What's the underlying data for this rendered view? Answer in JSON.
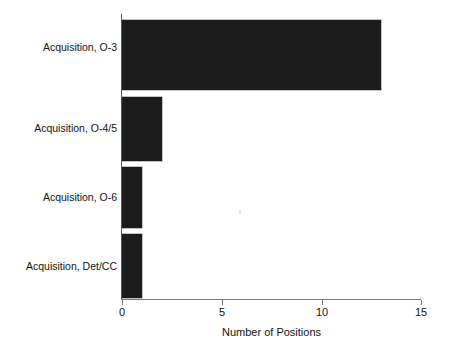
{
  "chart_data": {
    "type": "bar",
    "orientation": "horizontal",
    "title": "",
    "xlabel": "Number of Positions",
    "ylabel": "",
    "categories": [
      "Acquisition, O-3",
      "Acquisition, O-4/5",
      "Acquisition, O-6",
      "Acquisition, Det/CC"
    ],
    "values": [
      13,
      2,
      1,
      1
    ],
    "xlim": [
      0,
      15
    ],
    "xticks": [
      0,
      5,
      10,
      15
    ],
    "xticklabels": [
      "0",
      "5",
      "10",
      "15"
    ],
    "grid": false,
    "legend": null,
    "bar_color": "#1b1b1b",
    "background_color": "#ffffff",
    "axis_color": "#7c7c7c"
  },
  "axes": {
    "x_title": "Number of Positions",
    "x_tick_labels": [
      "0",
      "5",
      "10",
      "15"
    ],
    "y_tick_labels": [
      "Acquisition, O-3",
      "Acquisition, O-4/5",
      "Acquisition, O-6",
      "Acquisition, Det/CC"
    ]
  },
  "bars": [
    {
      "label": "Acquisition, O-3",
      "value": 13
    },
    {
      "label": "Acquisition, O-4/5",
      "value": 2
    },
    {
      "label": "Acquisition, O-6",
      "value": 1
    },
    {
      "label": "Acquisition, Det/CC",
      "value": 1
    }
  ]
}
